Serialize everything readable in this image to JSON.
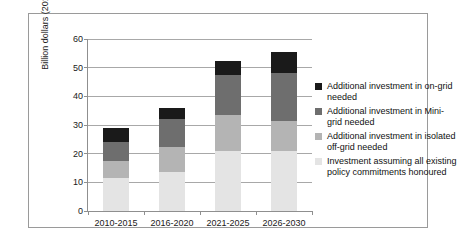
{
  "chart_data": {
    "type": "bar",
    "subtype": "stacked-bar",
    "title": "",
    "xlabel": "",
    "ylabel": "Billion dollars (2010)",
    "categories": [
      "2010-2015",
      "2016-2020",
      "2021-2025",
      "2026-2030"
    ],
    "ylim": [
      0,
      60
    ],
    "yticks": [
      0,
      10,
      20,
      30,
      40,
      50,
      60
    ],
    "ytick_labels": [
      "0",
      "10",
      "20",
      "30",
      "40",
      "50",
      "60"
    ],
    "grid": true,
    "legend_position": "right",
    "series": [
      {
        "name": "Investment assuming all existing policy commitments honoured",
        "color": "#e4e4e4",
        "values": [
          11.5,
          13.5,
          21.0,
          21.0
        ]
      },
      {
        "name": "Additional investment in isolated off-grid needed",
        "color": "#b4b4b4",
        "values": [
          6.0,
          9.0,
          12.5,
          10.5
        ]
      },
      {
        "name": "Additional investment in Mini-grid needed",
        "color": "#6e6e6e",
        "values": [
          6.5,
          9.5,
          14.0,
          16.5
        ]
      },
      {
        "name": "Additional investment in on-grid needed",
        "color": "#1a1a1a",
        "values": [
          5.0,
          4.0,
          5.0,
          7.5
        ]
      }
    ],
    "totals": [
      29.0,
      36.0,
      52.5,
      55.5
    ]
  },
  "legend": {
    "items": [
      {
        "label": "Additional investment in on-grid needed",
        "color": "#1a1a1a",
        "swatch_name": "legend-swatch-on-grid"
      },
      {
        "label": "Additional investment in Mini-grid needed",
        "color": "#6e6e6e",
        "swatch_name": "legend-swatch-mini-grid"
      },
      {
        "label": "Additional investment in isolated off-grid needed",
        "color": "#b4b4b4",
        "swatch_name": "legend-swatch-off-grid"
      },
      {
        "label": "Investment assuming all existing policy commitments honoured",
        "color": "#e4e4e4",
        "swatch_name": "legend-swatch-existing-policy"
      }
    ]
  },
  "axis": {
    "y_title": "Billion dollars (2010)"
  }
}
